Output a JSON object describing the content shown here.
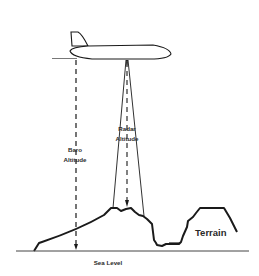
{
  "diagram": {
    "labels": {
      "radar_line1": "Radar",
      "radar_line2": "Altitude",
      "baro_line1": "Baro",
      "baro_line2": "Altitude",
      "terrain": "Terrain",
      "sea_level": "Sea Level"
    },
    "colors": {
      "stroke": "#1a1a1a",
      "background": "#ffffff"
    }
  }
}
